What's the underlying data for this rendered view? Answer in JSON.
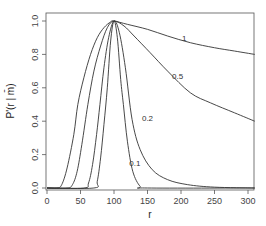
{
  "chart_data": {
    "type": "line",
    "title": "",
    "xlabel": "r",
    "ylabel": "P'(r | m̄)",
    "xlim": [
      0,
      310
    ],
    "ylim": [
      0,
      1.0
    ],
    "xticks": [
      0,
      50,
      100,
      150,
      200,
      250,
      300
    ],
    "yticks": [
      0.0,
      0.2,
      0.4,
      0.6,
      0.8,
      1.0
    ],
    "xtick_labels": [
      "0",
      "50",
      "100",
      "150",
      "200",
      "250",
      "300"
    ],
    "ytick_labels": [
      "0.0",
      "0.2",
      "0.4",
      "0.6",
      "0.8",
      "1.0"
    ],
    "grid": false,
    "legend": "none (curves labeled inline)",
    "series": [
      {
        "name": "1",
        "label_pos": [
          205,
          0.88
        ],
        "x": [
          0,
          15,
          22,
          30,
          40,
          46,
          55,
          65,
          75,
          85,
          95,
          100,
          120,
          150,
          180,
          214,
          250,
          280,
          310
        ],
        "y": [
          0,
          0,
          0.02,
          0.12,
          0.32,
          0.5,
          0.66,
          0.8,
          0.9,
          0.96,
          0.995,
          1.0,
          0.98,
          0.95,
          0.91,
          0.87,
          0.84,
          0.82,
          0.8
        ]
      },
      {
        "name": "0.5",
        "label_pos": [
          195,
          0.65
        ],
        "x": [
          0,
          30,
          38,
          45,
          52,
          61,
          70,
          80,
          90,
          100,
          115,
          130,
          154,
          180,
          214,
          244,
          280,
          310
        ],
        "y": [
          0,
          0,
          0.02,
          0.1,
          0.26,
          0.5,
          0.7,
          0.85,
          0.96,
          1.0,
          0.97,
          0.91,
          0.81,
          0.7,
          0.57,
          0.51,
          0.45,
          0.4
        ]
      },
      {
        "name": "0.2",
        "label_pos": [
          150,
          0.4
        ],
        "x": [
          0,
          55,
          62,
          68,
          74,
          79,
          85,
          92,
          100,
          108,
          117,
          127,
          139,
          157,
          180,
          210,
          250,
          310
        ],
        "y": [
          0,
          0,
          0.03,
          0.14,
          0.32,
          0.5,
          0.72,
          0.9,
          1.0,
          0.93,
          0.72,
          0.41,
          0.23,
          0.11,
          0.05,
          0.02,
          0.005,
          0
        ]
      },
      {
        "name": "0.1",
        "label_pos": [
          131,
          0.13
        ],
        "x": [
          0,
          70,
          75,
          80,
          85,
          90,
          95,
          100,
          105,
          110,
          114,
          120,
          128,
          139,
          150,
          310
        ],
        "y": [
          0,
          0,
          0.04,
          0.18,
          0.38,
          0.6,
          0.88,
          1.0,
          0.9,
          0.65,
          0.5,
          0.28,
          0.1,
          0.01,
          0,
          0
        ]
      }
    ]
  }
}
